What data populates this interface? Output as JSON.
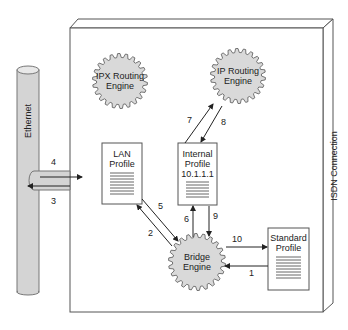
{
  "diagram": {
    "container_label": "ISDN Connection",
    "ethernet_label": "Ethernet",
    "engines": [
      {
        "id": "ipx",
        "line1": "IPX Routing",
        "line2": "Engine"
      },
      {
        "id": "ip",
        "line1": "IP Routing",
        "line2": "Engine"
      },
      {
        "id": "bridge",
        "line1": "Bridge",
        "line2": "Engine"
      }
    ],
    "profiles": [
      {
        "id": "lan",
        "line1": "LAN",
        "line2": "Profile",
        "line3": ""
      },
      {
        "id": "internal",
        "line1": "Internal",
        "line2": "Profile",
        "line3": "10.1.1.1"
      },
      {
        "id": "standard",
        "line1": "Standard",
        "line2": "Profile",
        "line3": ""
      }
    ],
    "steps": {
      "s1": "1",
      "s2": "2",
      "s3": "3",
      "s4": "4",
      "s5": "5",
      "s6": "6",
      "s7": "7",
      "s8": "8",
      "s9": "9",
      "s10": "10"
    },
    "colors": {
      "engine_fill": "#d9d9d9",
      "ethernet_fill": "#d4d4d4",
      "line": "#333333"
    }
  }
}
